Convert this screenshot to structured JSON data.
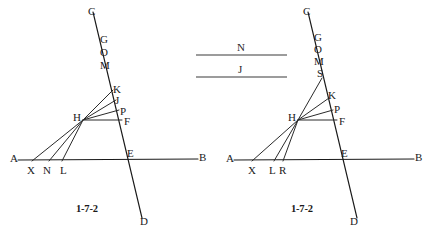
{
  "page": {
    "background_color": "#ffffff",
    "ink_color": "#1a1a1a",
    "width": 433,
    "height": 243
  },
  "legend": {
    "name": "segment-legend",
    "items": [
      {
        "label": "N",
        "x1": 196,
        "y1": 55,
        "x2": 287,
        "y2": 55,
        "label_x": 237,
        "label_y": 41
      },
      {
        "label": "J",
        "x1": 196,
        "y1": 77,
        "x2": 287,
        "y2": 77,
        "label_x": 238,
        "label_y": 63
      }
    ]
  },
  "figures": [
    {
      "name": "figure-left",
      "caption": "1-7-2",
      "caption_x": 76,
      "caption_y": 203,
      "lines": [
        {
          "name": "line-AB",
          "x1": 18,
          "y1": 160,
          "x2": 198,
          "y2": 159
        },
        {
          "name": "line-CD",
          "x1": 93,
          "y1": 12,
          "x2": 142,
          "y2": 218
        },
        {
          "name": "segment-HX",
          "x1": 83,
          "y1": 120,
          "x2": 32,
          "y2": 161
        },
        {
          "name": "segment-HN",
          "x1": 83,
          "y1": 120,
          "x2": 49,
          "y2": 161
        },
        {
          "name": "segment-HL",
          "x1": 83,
          "y1": 120,
          "x2": 62,
          "y2": 161
        },
        {
          "name": "segment-HK",
          "x1": 83,
          "y1": 120,
          "x2": 113,
          "y2": 90
        },
        {
          "name": "segment-HJ",
          "x1": 83,
          "y1": 120,
          "x2": 116,
          "y2": 100
        },
        {
          "name": "segment-HP",
          "x1": 83,
          "y1": 120,
          "x2": 119,
          "y2": 110
        },
        {
          "name": "segment-HF",
          "x1": 83,
          "y1": 120,
          "x2": 122,
          "y2": 120
        }
      ],
      "points": [
        {
          "label": "C",
          "x": 88,
          "y": 6
        },
        {
          "label": "G",
          "x": 100,
          "y": 34
        },
        {
          "label": "O",
          "x": 100,
          "y": 47
        },
        {
          "label": "M",
          "x": 100,
          "y": 60
        },
        {
          "label": "K",
          "x": 113,
          "y": 84
        },
        {
          "label": "J",
          "x": 115,
          "y": 95
        },
        {
          "label": "P",
          "x": 120,
          "y": 106
        },
        {
          "label": "H",
          "x": 73,
          "y": 112
        },
        {
          "label": "F",
          "x": 124,
          "y": 116
        },
        {
          "label": "A",
          "x": 10,
          "y": 153
        },
        {
          "label": "X",
          "x": 27,
          "y": 165
        },
        {
          "label": "N",
          "x": 43,
          "y": 165
        },
        {
          "label": "L",
          "x": 60,
          "y": 165
        },
        {
          "label": "E",
          "x": 127,
          "y": 148
        },
        {
          "label": "B",
          "x": 199,
          "y": 152
        },
        {
          "label": "D",
          "x": 140,
          "y": 216
        }
      ]
    },
    {
      "name": "figure-right",
      "caption": "1-7-2",
      "caption_x": 291,
      "caption_y": 203,
      "lines": [
        {
          "name": "line-AB",
          "x1": 234,
          "y1": 160,
          "x2": 414,
          "y2": 159
        },
        {
          "name": "line-CD",
          "x1": 308,
          "y1": 12,
          "x2": 357,
          "y2": 218
        },
        {
          "name": "segment-HX",
          "x1": 298,
          "y1": 120,
          "x2": 252,
          "y2": 161
        },
        {
          "name": "segment-HL",
          "x1": 298,
          "y1": 120,
          "x2": 274,
          "y2": 161
        },
        {
          "name": "segment-HR",
          "x1": 298,
          "y1": 120,
          "x2": 283,
          "y2": 161
        },
        {
          "name": "segment-HS",
          "x1": 298,
          "y1": 120,
          "x2": 322,
          "y2": 78
        },
        {
          "name": "segment-HK",
          "x1": 298,
          "y1": 120,
          "x2": 329,
          "y2": 98
        },
        {
          "name": "segment-HP",
          "x1": 298,
          "y1": 120,
          "x2": 333,
          "y2": 110
        },
        {
          "name": "segment-HF",
          "x1": 298,
          "y1": 120,
          "x2": 337,
          "y2": 120
        }
      ],
      "points": [
        {
          "label": "C",
          "x": 303,
          "y": 6
        },
        {
          "label": "G",
          "x": 314,
          "y": 32
        },
        {
          "label": "O",
          "x": 314,
          "y": 44
        },
        {
          "label": "M",
          "x": 314,
          "y": 56
        },
        {
          "label": "S",
          "x": 317,
          "y": 68
        },
        {
          "label": "K",
          "x": 328,
          "y": 90
        },
        {
          "label": "P",
          "x": 334,
          "y": 104
        },
        {
          "label": "H",
          "x": 288,
          "y": 112
        },
        {
          "label": "F",
          "x": 339,
          "y": 116
        },
        {
          "label": "A",
          "x": 226,
          "y": 153
        },
        {
          "label": "X",
          "x": 248,
          "y": 165
        },
        {
          "label": "L",
          "x": 269,
          "y": 165
        },
        {
          "label": "R",
          "x": 279,
          "y": 165
        },
        {
          "label": "E",
          "x": 341,
          "y": 148
        },
        {
          "label": "B",
          "x": 415,
          "y": 152
        },
        {
          "label": "D",
          "x": 350,
          "y": 216
        }
      ]
    }
  ]
}
